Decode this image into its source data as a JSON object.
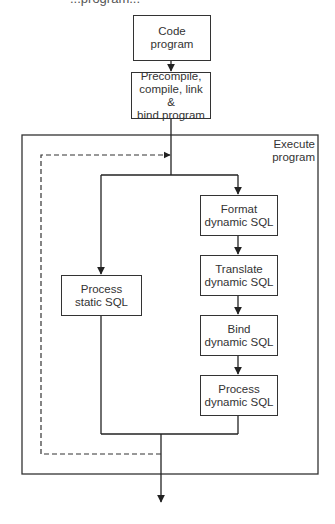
{
  "diagram": {
    "top_clipped_text": "...program...",
    "nodes": {
      "code_program": "Code\nprogram",
      "precompile": "Precompile,\ncompile, link &\nbind program",
      "execute_program": "Execute\nprogram",
      "process_static": "Process\nstatic SQL",
      "format_dynamic": "Format\ndynamic SQL",
      "translate_dynamic": "Translate\ndynamic SQL",
      "bind_dynamic": "Bind\ndynamic SQL",
      "process_dynamic": "Process\ndynamic SQL"
    },
    "edges": [
      {
        "from": "code_program",
        "to": "precompile",
        "style": "solid"
      },
      {
        "from": "precompile",
        "to": "execute_program",
        "style": "solid"
      },
      {
        "from": "execute_program",
        "to": "process_static",
        "style": "solid"
      },
      {
        "from": "execute_program",
        "to": "format_dynamic",
        "style": "solid"
      },
      {
        "from": "format_dynamic",
        "to": "translate_dynamic",
        "style": "solid"
      },
      {
        "from": "translate_dynamic",
        "to": "bind_dynamic",
        "style": "solid"
      },
      {
        "from": "bind_dynamic",
        "to": "process_dynamic",
        "style": "solid"
      },
      {
        "from": "process_static",
        "to": "exit",
        "style": "solid"
      },
      {
        "from": "process_dynamic",
        "to": "exit",
        "style": "solid"
      },
      {
        "from": "exit",
        "to": "execute_program",
        "style": "dashed",
        "label": "loop"
      }
    ],
    "colors": {
      "line": "#333333",
      "background": "#ffffff"
    }
  }
}
